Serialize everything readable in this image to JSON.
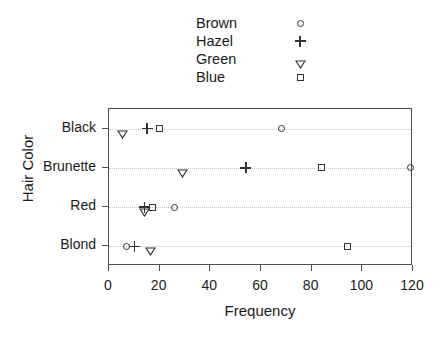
{
  "chart_data": {
    "type": "scatter",
    "title": "",
    "xlabel": "Frequency",
    "ylabel": "Hair Color",
    "categories": [
      "Black",
      "Brunette",
      "Red",
      "Blond"
    ],
    "xlim": [
      0,
      120
    ],
    "xticks": [
      0,
      20,
      40,
      60,
      80,
      100,
      120
    ],
    "xtick_labels": [
      "0",
      "20",
      "40",
      "60",
      "80",
      "100",
      "120"
    ],
    "grid": true,
    "legend_position": "top",
    "series": [
      {
        "name": "Brown",
        "marker": "circle",
        "categories": [
          "Black",
          "Brunette",
          "Red",
          "Blond"
        ],
        "values": [
          68,
          119,
          26,
          7
        ]
      },
      {
        "name": "Hazel",
        "marker": "plus",
        "categories": [
          "Black",
          "Brunette",
          "Red",
          "Blond"
        ],
        "values": [
          15,
          54,
          14,
          10
        ]
      },
      {
        "name": "Green",
        "marker": "triangle-down",
        "categories": [
          "Black",
          "Brunette",
          "Red",
          "Blond"
        ],
        "values": [
          5,
          29,
          14,
          16
        ]
      },
      {
        "name": "Blue",
        "marker": "square",
        "categories": [
          "Black",
          "Brunette",
          "Red",
          "Blond"
        ],
        "values": [
          20,
          84,
          17,
          94
        ]
      }
    ]
  },
  "legend": {
    "items": [
      {
        "label": "Brown",
        "marker": "circle"
      },
      {
        "label": "Hazel",
        "marker": "plus"
      },
      {
        "label": "Green",
        "marker": "triangle-down"
      },
      {
        "label": "Blue",
        "marker": "square"
      }
    ]
  },
  "colors": {
    "marker": "#333333",
    "axis": "#4d4d4d",
    "grid": "#c8c8c8",
    "background": "#ffffff"
  }
}
